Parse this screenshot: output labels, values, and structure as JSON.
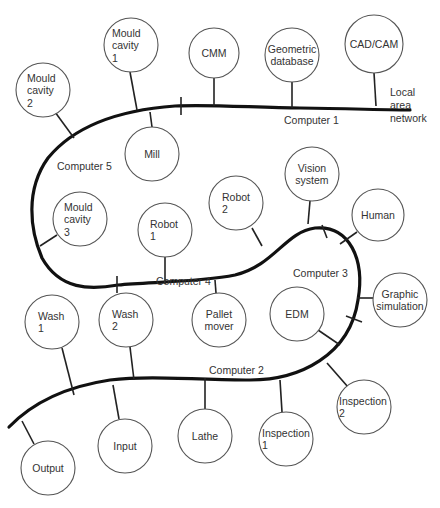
{
  "diagram": {
    "network_label": [
      "Local",
      "area",
      "network"
    ],
    "computers": [
      {
        "id": "c1",
        "label": "Computer 1"
      },
      {
        "id": "c2",
        "label": "Computer 2"
      },
      {
        "id": "c3",
        "label": "Computer 3"
      },
      {
        "id": "c4",
        "label": "Computer 4"
      },
      {
        "id": "c5",
        "label": "Computer 5"
      }
    ],
    "nodes": [
      {
        "id": "mould-cavity-1",
        "lines": [
          "Mould",
          "cavity",
          "1"
        ],
        "segment": "Computer 5"
      },
      {
        "id": "mould-cavity-2",
        "lines": [
          "Mould",
          "cavity",
          "2"
        ],
        "segment": "Computer 5"
      },
      {
        "id": "mill",
        "lines": [
          "Mill"
        ],
        "segment": "Computer 5"
      },
      {
        "id": "mould-cavity-3",
        "lines": [
          "Mould",
          "cavity",
          "3"
        ],
        "segment": "Computer 5"
      },
      {
        "id": "cmm",
        "lines": [
          "CMM"
        ],
        "segment": "Computer 1"
      },
      {
        "id": "geometric-database",
        "lines": [
          "Geometric",
          "database"
        ],
        "segment": "Computer 1"
      },
      {
        "id": "cad-cam",
        "lines": [
          "CAD/CAM"
        ],
        "segment": "Computer 1"
      },
      {
        "id": "robot-1",
        "lines": [
          "Robot",
          "1"
        ],
        "segment": "Computer 4"
      },
      {
        "id": "robot-2",
        "lines": [
          "Robot",
          "2"
        ],
        "segment": "Computer 4"
      },
      {
        "id": "pallet-mover",
        "lines": [
          "Pallet",
          "mover"
        ],
        "segment": "Computer 4"
      },
      {
        "id": "vision-system",
        "lines": [
          "Vision",
          "system"
        ],
        "segment": "Computer 3"
      },
      {
        "id": "human",
        "lines": [
          "Human"
        ],
        "segment": "Computer 3"
      },
      {
        "id": "graphic-simulation",
        "lines": [
          "Graphic",
          "simulation"
        ],
        "segment": "Computer 3"
      },
      {
        "id": "edm",
        "lines": [
          "EDM"
        ],
        "segment": "Computer 3"
      },
      {
        "id": "wash-1",
        "lines": [
          "Wash",
          "1"
        ],
        "segment": "Computer 2"
      },
      {
        "id": "wash-2",
        "lines": [
          "Wash",
          "2"
        ],
        "segment": "Computer 2"
      },
      {
        "id": "input",
        "lines": [
          "Input"
        ],
        "segment": "Computer 2"
      },
      {
        "id": "lathe",
        "lines": [
          "Lathe"
        ],
        "segment": "Computer 2"
      },
      {
        "id": "inspection-1",
        "lines": [
          "Inspection",
          "1"
        ],
        "segment": "Computer 2"
      },
      {
        "id": "inspection-2",
        "lines": [
          "Inspection",
          "2"
        ],
        "segment": "Computer 2"
      },
      {
        "id": "output",
        "lines": [
          "Output"
        ],
        "segment": "Computer 2"
      }
    ]
  }
}
